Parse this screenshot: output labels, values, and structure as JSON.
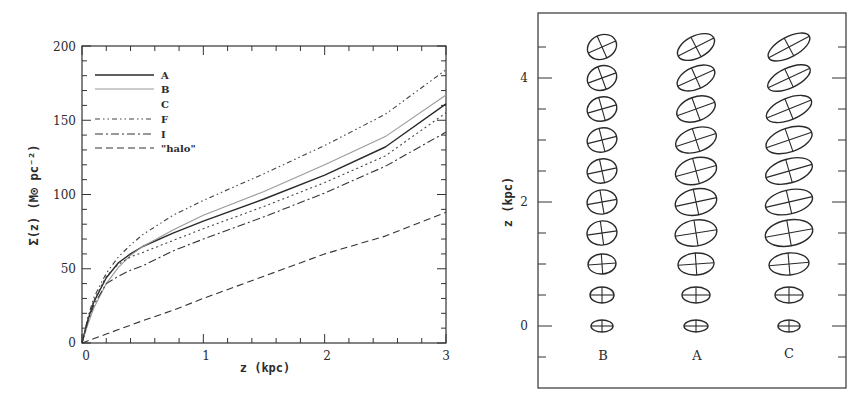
{
  "chart_data": [
    {
      "type": "line",
      "title": "",
      "xlabel": "z (kpc)",
      "ylabel": "Σ(z) (M⊙ pc⁻²)",
      "xlim": [
        0,
        3
      ],
      "ylim": [
        0,
        200
      ],
      "xticks": [
        0,
        1,
        2,
        3
      ],
      "yticks": [
        0,
        50,
        100,
        150,
        200
      ],
      "x_minor_step": 0.2,
      "y_minor_step": 10,
      "grid": false,
      "legend_position": "upper-left",
      "x": [
        0,
        0.05,
        0.1,
        0.2,
        0.3,
        0.4,
        0.5,
        0.75,
        1.0,
        1.5,
        2.0,
        2.5,
        3.0
      ],
      "series": [
        {
          "name": "A",
          "style": "solid",
          "color": "#2a2a2a",
          "values": [
            0,
            16,
            28,
            44,
            54,
            60,
            65,
            74,
            82,
            97,
            113,
            132,
            161
          ]
        },
        {
          "name": "B",
          "style": "solid-light",
          "color": "#9a9a9a",
          "values": [
            0,
            13,
            24,
            40,
            51,
            59,
            65,
            76,
            86,
            102,
            120,
            139,
            167
          ]
        },
        {
          "name": "C",
          "style": "dotted",
          "color": "#444444",
          "values": [
            0,
            17,
            29,
            45,
            53,
            58,
            61,
            69,
            77,
            92,
            108,
            126,
            155
          ]
        },
        {
          "name": "F",
          "style": "dash-dot-dot",
          "color": "#444444",
          "values": [
            0,
            18,
            31,
            47,
            58,
            66,
            73,
            86,
            96,
            114,
            133,
            154,
            184
          ]
        },
        {
          "name": "I",
          "style": "dash-dot",
          "color": "#333333",
          "values": [
            0,
            15,
            26,
            40,
            45,
            49,
            52,
            62,
            70,
            85,
            101,
            119,
            142
          ]
        },
        {
          "name": "\"halo\"",
          "style": "dashed",
          "color": "#333333",
          "values": [
            0,
            1.5,
            3,
            6,
            9,
            12,
            15,
            22,
            30,
            45,
            60,
            72,
            88
          ]
        }
      ]
    },
    {
      "type": "scatter",
      "title": "",
      "xlabel": "",
      "ylabel": "z (kpc)",
      "ylim": [
        -1,
        5
      ],
      "yticks": [
        0,
        2,
        4
      ],
      "y_minor_step": 0.5,
      "grid": false,
      "marker": "tilted-ellipse-with-axes",
      "categories": [
        "B",
        "A",
        "C"
      ],
      "z": [
        0,
        0.5,
        1.0,
        1.5,
        2.0,
        2.5,
        3.0,
        3.5,
        4.0,
        4.5
      ],
      "series": [
        {
          "name": "B",
          "semi_major_px": [
            11,
            12,
            14,
            15,
            15,
            15,
            15,
            15,
            15,
            15
          ],
          "semi_minor_px": [
            6,
            8,
            10,
            12,
            12,
            12,
            12,
            12,
            12,
            12
          ],
          "tilt_deg": [
            0,
            0,
            -4,
            -8,
            -10,
            -12,
            -14,
            -16,
            -20,
            -24
          ]
        },
        {
          "name": "A",
          "semi_major_px": [
            12,
            14,
            18,
            21,
            21,
            21,
            21,
            20,
            20,
            20
          ],
          "semi_minor_px": [
            6,
            8,
            11,
            13,
            13,
            13,
            12,
            12,
            11,
            11
          ],
          "tilt_deg": [
            0,
            0,
            -4,
            -9,
            -12,
            -15,
            -18,
            -20,
            -24,
            -27
          ]
        },
        {
          "name": "C",
          "semi_major_px": [
            11,
            14,
            20,
            24,
            24,
            24,
            24,
            24,
            23,
            23
          ],
          "semi_minor_px": [
            6,
            8,
            11,
            13,
            12,
            12,
            12,
            11,
            10,
            10
          ],
          "tilt_deg": [
            0,
            0,
            -5,
            -10,
            -13,
            -16,
            -19,
            -22,
            -25,
            -28
          ]
        }
      ]
    }
  ],
  "left_panel": {
    "ylabel": "Σ(z) (M⊙ pc⁻²)",
    "xlabel": "z (kpc)",
    "xtick_labels": [
      "0",
      "1",
      "2",
      "3"
    ],
    "ytick_labels": [
      "0",
      "50",
      "100",
      "150",
      "200"
    ],
    "legend": [
      "A",
      "B",
      "C",
      "F",
      "I",
      "\"halo\""
    ]
  },
  "right_panel": {
    "ylabel": "z (kpc)",
    "ytick_labels": [
      "0",
      "2",
      "4"
    ],
    "column_labels": [
      "B",
      "A",
      "C"
    ]
  }
}
